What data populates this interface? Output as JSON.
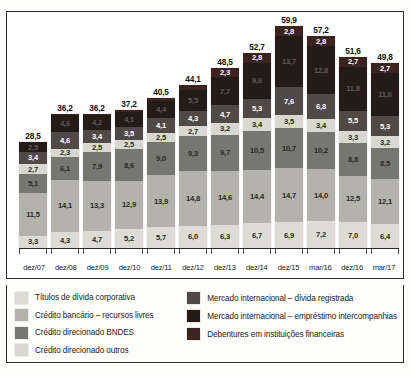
{
  "chart_data": {
    "type": "bar",
    "subtype": "stacked-vertical",
    "title": "",
    "xlabel": "",
    "ylabel": "",
    "grid": false,
    "legend_position": "bottom",
    "ylim": [
      0,
      59.9
    ],
    "categories": [
      "dez/07",
      "dez/08",
      "dez/09",
      "dez/10",
      "dez/11",
      "dez/12",
      "dez/13",
      "dez/14",
      "dez/15",
      "mar/16",
      "dez/16",
      "mar/17"
    ],
    "totals": [
      "28,5",
      "36,2",
      "36,2",
      "37,2",
      "40,5",
      "44,1",
      "48,5",
      "52,7",
      "59,9",
      "57,2",
      "51,6",
      "49,8"
    ],
    "totals_numeric": [
      28.5,
      36.2,
      36.2,
      37.2,
      40.5,
      44.1,
      48.5,
      52.7,
      59.9,
      57.2,
      51.6,
      49.8
    ],
    "series": [
      {
        "name": "Títulos de dívida corporativa",
        "color": "#dcdcd4",
        "text_color": "dark",
        "labels": [
          "3,3",
          "4,3",
          "4,7",
          "5,2",
          "5,7",
          "6,0",
          "6,3",
          "6,7",
          "6,9",
          "7,2",
          "7,0",
          "6,4"
        ],
        "values": [
          3.3,
          4.3,
          4.7,
          5.2,
          5.7,
          6.0,
          6.3,
          6.7,
          6.9,
          7.2,
          7.0,
          6.4
        ]
      },
      {
        "name": "Crédito bancário – recursos livres",
        "color": "#b3b3ab",
        "text_color": "dark",
        "labels": [
          "11,5",
          "14,1",
          "13,3",
          "12,9",
          "13,9",
          "14,8",
          "14,6",
          "14,4",
          "14,7",
          "14,0",
          "12,5",
          "12,1"
        ],
        "values": [
          11.5,
          14.1,
          13.3,
          12.9,
          13.9,
          14.8,
          14.6,
          14.4,
          14.7,
          14.0,
          12.5,
          12.1
        ]
      },
      {
        "name": "Crédito direcionado BNDES",
        "color": "#777772",
        "text_color": "dark",
        "labels": [
          "5,1",
          "6,1",
          "7,9",
          "8,6",
          "9,0",
          "9,3",
          "9,7",
          "10,5",
          "10,7",
          "10,2",
          "8,8",
          "8,5"
        ],
        "values": [
          5.1,
          6.1,
          7.9,
          8.6,
          9.0,
          9.3,
          9.7,
          10.5,
          10.7,
          10.2,
          8.8,
          8.5
        ]
      },
      {
        "name": "Crédito direcionado outros",
        "color": "#d8d8d0",
        "text_color": "dark",
        "labels": [
          "2,7",
          "2,3",
          "2,5",
          "2,5",
          "2,5",
          "2,7",
          "3,2",
          "3,4",
          "3,5",
          "3,4",
          "3,3",
          "3,2"
        ],
        "values": [
          2.7,
          2.3,
          2.5,
          2.5,
          2.5,
          2.7,
          3.2,
          3.4,
          3.5,
          3.4,
          3.3,
          3.2
        ]
      },
      {
        "name": "Mercado internacional – dívida registrada",
        "color": "#504a46",
        "text_color": "light",
        "labels": [
          "3,4",
          "4,6",
          "3,4",
          "3,5",
          "4,1",
          "4,3",
          "4,7",
          "5,3",
          "7,6",
          "6,8",
          "5,5",
          "5,3"
        ],
        "values": [
          3.4,
          4.6,
          3.4,
          3.5,
          4.1,
          4.3,
          4.7,
          5.3,
          7.6,
          6.8,
          5.5,
          5.3
        ]
      },
      {
        "name": "Mercado internacional – empréstimo intercompanhias",
        "color": "#241b17",
        "text_color": "faint",
        "labels": [
          "2,5",
          "4,6",
          "4,2",
          "4,1",
          "4,4",
          "5,5",
          "7,7",
          "9,6",
          "13,7",
          "12,8",
          "11,8",
          "11,6"
        ],
        "values": [
          2.5,
          4.6,
          4.2,
          4.1,
          4.4,
          5.5,
          7.7,
          9.6,
          13.7,
          12.8,
          11.8,
          11.6
        ]
      },
      {
        "name": "Debentures em instituições financeiras",
        "color": "#3b231f",
        "text_color": "light",
        "labels": [
          "",
          "0,2",
          "0,2",
          "0,4",
          "0,9",
          "1,5",
          "2,3",
          "2,8",
          "2,8",
          "2,8",
          "2,7",
          "2,7"
        ],
        "values": [
          0.0,
          0.2,
          0.2,
          0.4,
          0.9,
          1.5,
          2.3,
          2.8,
          2.8,
          2.8,
          2.7,
          2.7
        ]
      }
    ]
  },
  "legend": {
    "left": [
      {
        "label": "Títulos de dívida corporativa",
        "color": "#dcdcd4"
      },
      {
        "label": "Crédito bancário – recursos livres",
        "color": "#b3b3ab"
      },
      {
        "label": "Crédito direcionado BNDES",
        "color": "#777772"
      },
      {
        "label": "Crédito direcionado outros",
        "color": "#d8d8d0"
      }
    ],
    "right": [
      {
        "label": "Mercado internacional – dívida registrada",
        "color": "#504a46"
      },
      {
        "label": "Mercado internacional – empréstimo intercompanhias",
        "color": "#241b17"
      },
      {
        "label": "Debentures em instituições financeiras",
        "color": "#3b231f"
      }
    ]
  }
}
